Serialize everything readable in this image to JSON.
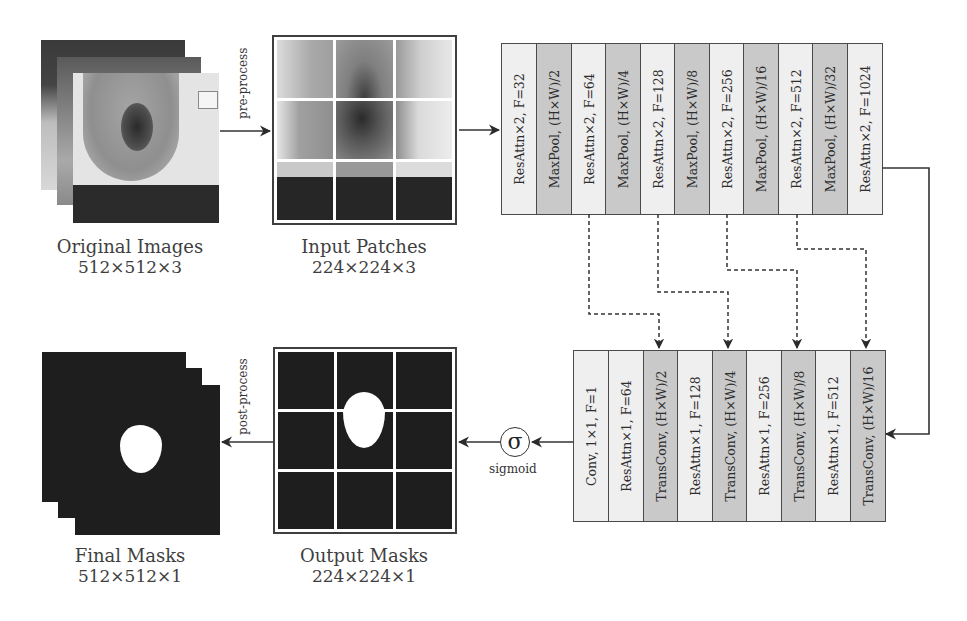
{
  "diagram": {
    "original_images": {
      "title": "Original Images",
      "dims": "512×512×3"
    },
    "input_patches": {
      "title": "Input Patches",
      "dims": "224×224×3"
    },
    "output_masks": {
      "title": "Output Masks",
      "dims": "224×224×1"
    },
    "final_masks": {
      "title": "Final Masks",
      "dims": "512×512×1"
    },
    "arrows": {
      "pre_process": "pre-process",
      "post_process": "post-process"
    },
    "sigmoid": {
      "symbol": "σ",
      "label": "sigmoid"
    },
    "encoder": {
      "layers": [
        {
          "label": "ResAttn×2, F=32",
          "shade": "light"
        },
        {
          "label": "MaxPool, (H×W)/2",
          "shade": "dark"
        },
        {
          "label": "ResAttn×2, F=64",
          "shade": "light"
        },
        {
          "label": "MaxPool, (H×W)/4",
          "shade": "dark"
        },
        {
          "label": "ResAttn×2, F=128",
          "shade": "light"
        },
        {
          "label": "MaxPool, (H×W)/8",
          "shade": "dark"
        },
        {
          "label": "ResAttn×2, F=256",
          "shade": "light"
        },
        {
          "label": "MaxPool, (H×W)/16",
          "shade": "dark"
        },
        {
          "label": "ResAttn×2, F=512",
          "shade": "light"
        },
        {
          "label": "MaxPool, (H×W)/32",
          "shade": "dark"
        },
        {
          "label": "ResAttn×2, F=1024",
          "shade": "light"
        }
      ]
    },
    "decoder": {
      "layers": [
        {
          "label": "Conv, 1×1, F=1",
          "shade": "light"
        },
        {
          "label": "ResAttn×1, F=64",
          "shade": "light"
        },
        {
          "label": "TransConv, (H×W)/2",
          "shade": "dark"
        },
        {
          "label": "ResAttn×1, F=128",
          "shade": "light"
        },
        {
          "label": "TransConv, (H×W)/4",
          "shade": "dark"
        },
        {
          "label": "ResAttn×1, F=256",
          "shade": "light"
        },
        {
          "label": "TransConv, (H×W)/8",
          "shade": "dark"
        },
        {
          "label": "ResAttn×1, F=512",
          "shade": "light"
        },
        {
          "label": "TransConv, (H×W)/16",
          "shade": "dark"
        }
      ]
    },
    "skip_connections": [
      {
        "from": "ResAttn×2, F=64",
        "to": "TransConv, (H×W)/2"
      },
      {
        "from": "ResAttn×2, F=128",
        "to": "TransConv, (H×W)/4"
      },
      {
        "from": "ResAttn×2, F=256",
        "to": "TransConv, (H×W)/8"
      },
      {
        "from": "ResAttn×2, F=512",
        "to": "TransConv, (H×W)/16"
      }
    ]
  }
}
